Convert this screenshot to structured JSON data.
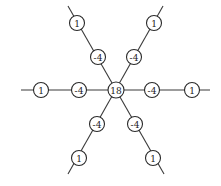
{
  "diagram": {
    "type": "star-graph-weights",
    "center": {
      "id": "c",
      "label": "18",
      "x": 116,
      "y": 90,
      "r": 8
    },
    "node_radius": 7.5,
    "nodes": [
      {
        "id": "w-in",
        "label": "-4",
        "x": 79,
        "y": 90
      },
      {
        "id": "w-out",
        "label": "1",
        "x": 41,
        "y": 90
      },
      {
        "id": "e-in",
        "label": "-4",
        "x": 152,
        "y": 90
      },
      {
        "id": "e-out",
        "label": "1",
        "x": 192,
        "y": 90
      },
      {
        "id": "nw-in",
        "label": "-4",
        "x": 98,
        "y": 57
      },
      {
        "id": "nw-out",
        "label": "1",
        "x": 77,
        "y": 23
      },
      {
        "id": "ne-in",
        "label": "-4",
        "x": 134,
        "y": 57
      },
      {
        "id": "ne-out",
        "label": "1",
        "x": 154,
        "y": 23
      },
      {
        "id": "sw-in",
        "label": "-4",
        "x": 97,
        "y": 124
      },
      {
        "id": "sw-out",
        "label": "1",
        "x": 79,
        "y": 158
      },
      {
        "id": "se-in",
        "label": "-4",
        "x": 135,
        "y": 124
      },
      {
        "id": "se-out",
        "label": "1",
        "x": 153,
        "y": 158
      }
    ],
    "edges": [
      {
        "x1": 21,
        "y1": 90,
        "x2": 210,
        "y2": 90
      },
      {
        "x1": 68,
        "y1": 6,
        "x2": 164,
        "y2": 174
      },
      {
        "x1": 163,
        "y1": 6,
        "x2": 68,
        "y2": 174
      }
    ]
  }
}
